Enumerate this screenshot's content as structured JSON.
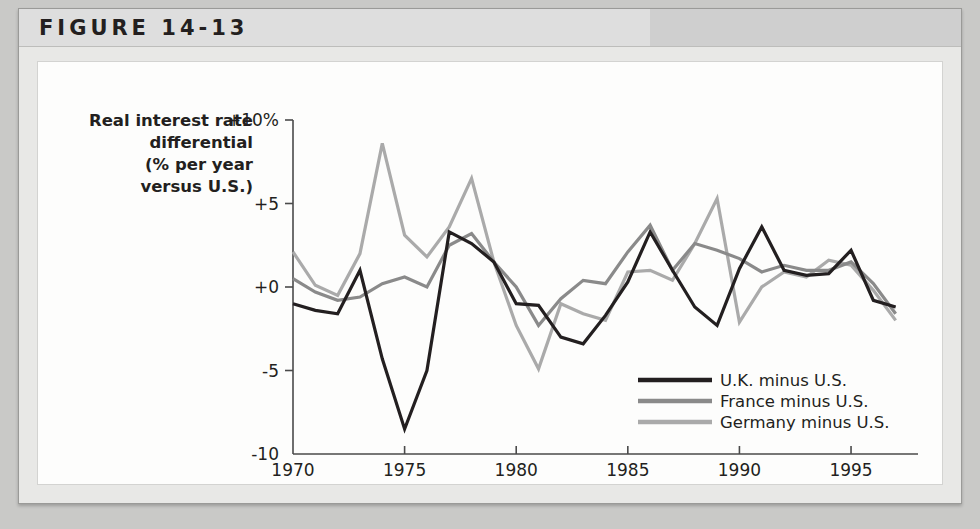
{
  "figure": {
    "label": "FIGURE 14-13"
  },
  "chart_data": {
    "type": "line",
    "title": "",
    "xlabel": "",
    "ylabel": "Real interest rate differential (% per year versus U.S.)",
    "ylabel_lines": [
      "Real interest rate",
      "differential",
      "(% per year",
      "versus U.S.)"
    ],
    "xlim": [
      1970,
      1998
    ],
    "ylim": [
      -10,
      10
    ],
    "grid": false,
    "legend_position": "inside-bottom-right",
    "ytick_labels": [
      "+10%",
      "+5",
      "+0",
      "-5",
      "-10"
    ],
    "ytick_values": [
      10,
      5,
      0,
      -5,
      -10
    ],
    "xtick_labels": [
      "1970",
      "1975",
      "1980",
      "1985",
      "1990",
      "1995"
    ],
    "xtick_values": [
      1970,
      1975,
      1980,
      1985,
      1990,
      1995
    ],
    "x": [
      1970,
      1971,
      1972,
      1973,
      1974,
      1975,
      1976,
      1977,
      1978,
      1979,
      1980,
      1981,
      1982,
      1983,
      1984,
      1985,
      1986,
      1987,
      1988,
      1989,
      1990,
      1991,
      1992,
      1993,
      1994,
      1995,
      1996,
      1997
    ],
    "series": [
      {
        "name": "U.K. minus U.S.",
        "color": "#231f20",
        "width": 3.2,
        "values": [
          -1.0,
          -1.4,
          -1.6,
          1.0,
          -4.3,
          -8.5,
          -5.0,
          3.3,
          2.6,
          1.5,
          -1.0,
          -1.1,
          -3.0,
          -3.4,
          -1.7,
          0.3,
          3.3,
          1.0,
          -1.2,
          -2.3,
          1.1,
          3.6,
          1.0,
          0.7,
          0.8,
          2.2,
          -0.8,
          -1.2
        ]
      },
      {
        "name": "France minus U.S.",
        "color": "#8a8a8a",
        "width": 3.2,
        "values": [
          0.5,
          -0.3,
          -0.8,
          -0.6,
          0.2,
          0.6,
          0.0,
          2.5,
          3.2,
          1.5,
          0.0,
          -2.3,
          -0.7,
          0.4,
          0.2,
          2.1,
          3.7,
          1.0,
          2.6,
          2.2,
          1.7,
          0.9,
          1.3,
          1.0,
          1.0,
          1.5,
          0.2,
          -1.6
        ]
      },
      {
        "name": "Germany minus U.S.",
        "color": "#aaaaaa",
        "width": 3.2,
        "values": [
          2.1,
          0.1,
          -0.5,
          2.0,
          8.6,
          3.1,
          1.8,
          3.6,
          6.5,
          1.5,
          -2.3,
          -4.9,
          -1.0,
          -1.6,
          -2.0,
          0.9,
          1.0,
          0.4,
          2.6,
          5.3,
          -2.1,
          0.0,
          0.9,
          0.6,
          1.6,
          1.3,
          -0.2,
          -2.0
        ]
      }
    ]
  },
  "legend": {
    "items": [
      {
        "label": "U.K. minus U.S.",
        "color": "#231f20"
      },
      {
        "label": "France minus U.S.",
        "color": "#8a8a8a"
      },
      {
        "label": "Germany minus U.S.",
        "color": "#aaaaaa"
      }
    ]
  }
}
